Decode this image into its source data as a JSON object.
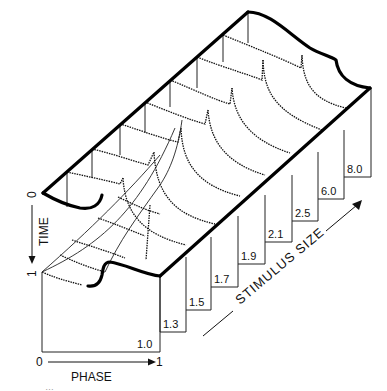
{
  "figure": {
    "axes": {
      "time": {
        "label": "TIME",
        "start": "0",
        "end": "1"
      },
      "phase": {
        "label": "PHASE",
        "start": "0",
        "end": "1"
      },
      "stimulus": {
        "label": "STIMULUS SIZE"
      }
    },
    "stimulus_sizes": [
      "1.0",
      "1.3",
      "1.5",
      "1.7",
      "1.9",
      "2.1",
      "2.5",
      "6.0",
      "8.0"
    ],
    "caption_fragment": "…"
  }
}
